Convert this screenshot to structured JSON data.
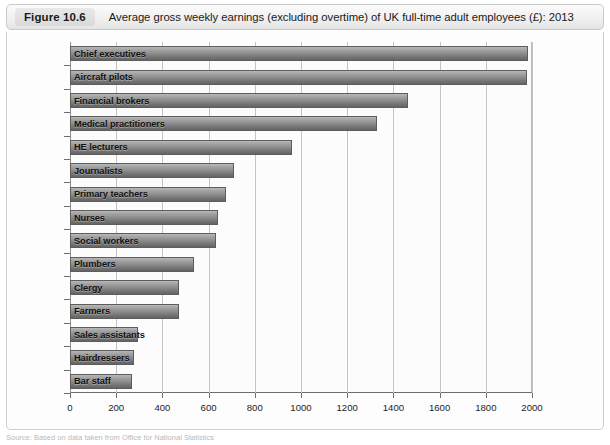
{
  "figure": {
    "tag": "Figure 10.6",
    "title": "Average gross weekly earnings (excluding overtime) of UK full-time adult employees (£): 2013"
  },
  "source": {
    "text": "Source: Based on data taken from Office for National Statistics"
  },
  "chart_data": {
    "type": "bar",
    "orientation": "horizontal",
    "title": "Average gross weekly earnings (excluding overtime) of UK full-time adult employees (£): 2013",
    "xlabel": "",
    "ylabel": "",
    "xlim": [
      0,
      2000
    ],
    "xticks": [
      0,
      200,
      400,
      600,
      800,
      1000,
      1200,
      1400,
      1600,
      1800,
      2000
    ],
    "xtick_labels": [
      "0",
      "200",
      "400",
      "600",
      "800",
      "1000",
      "1200",
      "1400",
      "1600",
      "1800",
      "2000"
    ],
    "grid": true,
    "legend": null,
    "bar_color": "#8e8e8e",
    "categories": [
      "Chief executives",
      "Aircraft pilots",
      "Financial brokers",
      "Medical practitioners",
      "HE lecturers",
      "Journalists",
      "Primary teachers",
      "Nurses",
      "Social workers",
      "Plumbers",
      "Clergy",
      "Farmers",
      "Sales assistants",
      "Hairdressers",
      "Bar staff"
    ],
    "values": [
      1983,
      1980,
      1463,
      1329,
      961,
      710,
      675,
      640,
      632,
      537,
      472,
      470,
      295,
      277,
      268
    ]
  }
}
